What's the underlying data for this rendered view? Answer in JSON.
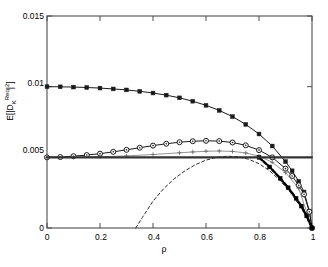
{
  "chart_data": {
    "type": "line",
    "title": "",
    "xlabel": "ρ",
    "ylabel": "E[|D_K^Req|^2]",
    "xlim": [
      0,
      1
    ],
    "ylim": [
      0,
      0.015
    ],
    "grid": false,
    "legend": "none",
    "xticks": [
      "0",
      "0.2",
      "0.4",
      "0.6",
      "0.8",
      "1"
    ],
    "xtick_values": [
      0,
      0.2,
      0.4,
      0.6,
      0.8,
      1
    ],
    "yticks": [
      "0",
      "0.005",
      "0.01",
      "0.015"
    ],
    "ytick_values": [
      0,
      0.005,
      0.01,
      0.015
    ],
    "series": [
      {
        "name": "upper-curve-filled-square",
        "marker": "filled-square",
        "linestyle": "solid",
        "color": "#1a1a1a",
        "x": [
          0.0,
          0.05,
          0.1,
          0.15,
          0.2,
          0.25,
          0.3,
          0.35,
          0.4,
          0.45,
          0.5,
          0.55,
          0.6,
          0.65,
          0.7,
          0.75,
          0.8,
          0.85,
          0.9,
          0.925,
          0.95,
          0.97,
          0.99,
          1.0
        ],
        "y": [
          0.01,
          0.00999,
          0.00997,
          0.00994,
          0.0099,
          0.00984,
          0.00977,
          0.00967,
          0.00955,
          0.0094,
          0.00921,
          0.00897,
          0.00868,
          0.00832,
          0.00788,
          0.00733,
          0.00665,
          0.0058,
          0.0047,
          0.00405,
          0.0033,
          0.00255,
          0.0012,
          0.0
        ]
      },
      {
        "name": "middle-curve-open-circle",
        "marker": "open-circle",
        "linestyle": "solid",
        "color": "#1a1a1a",
        "x": [
          0.0,
          0.05,
          0.1,
          0.15,
          0.2,
          0.25,
          0.3,
          0.35,
          0.4,
          0.45,
          0.5,
          0.55,
          0.6,
          0.65,
          0.7,
          0.75,
          0.8,
          0.85,
          0.9,
          0.925,
          0.95,
          0.97,
          0.99,
          1.0
        ],
        "y": [
          0.005,
          0.00502,
          0.00508,
          0.00516,
          0.00526,
          0.00539,
          0.00553,
          0.00568,
          0.00583,
          0.00596,
          0.00607,
          0.00614,
          0.00617,
          0.00615,
          0.00605,
          0.00585,
          0.00551,
          0.005,
          0.0042,
          0.00368,
          0.00302,
          0.00238,
          0.00115,
          0.0
        ]
      },
      {
        "name": "thin-curve-plus-marker",
        "marker": "plus",
        "linestyle": "thin-solid",
        "color": "#666666",
        "x": [
          0.0,
          0.1,
          0.2,
          0.3,
          0.4,
          0.5,
          0.55,
          0.6,
          0.65,
          0.7,
          0.75,
          0.8,
          0.85,
          0.9,
          0.95,
          1.0
        ],
        "y": [
          0.005,
          0.00501,
          0.00504,
          0.0051,
          0.0052,
          0.00532,
          0.00538,
          0.00543,
          0.00545,
          0.00542,
          0.00531,
          0.00508,
          0.00465,
          0.00392,
          0.0028,
          0.0
        ]
      },
      {
        "name": "lower-dashed-curve",
        "marker": "none",
        "linestyle": "dashed",
        "color": "#2b2b2b",
        "x": [
          0.335,
          0.36,
          0.4,
          0.44,
          0.48,
          0.52,
          0.56,
          0.6,
          0.64,
          0.68,
          0.72,
          0.76,
          0.8,
          0.84,
          0.88,
          0.92,
          0.96,
          1.0
        ],
        "y": [
          0.0,
          0.00075,
          0.0019,
          0.00278,
          0.00348,
          0.00404,
          0.00448,
          0.0048,
          0.005,
          0.00508,
          0.00504,
          0.00487,
          0.00455,
          0.00405,
          0.00335,
          0.00248,
          0.0014,
          0.0
        ]
      },
      {
        "name": "bold-dashed-overlay",
        "marker": "filled-square",
        "linestyle": "bold-dashed",
        "color": "#000000",
        "x": [
          0.8,
          0.84,
          0.88,
          0.91,
          0.94,
          0.96,
          0.98,
          1.0
        ],
        "y": [
          0.005,
          0.00432,
          0.00352,
          0.00285,
          0.0021,
          0.00155,
          0.00085,
          0.0
        ]
      },
      {
        "name": "horizontal-reference-line",
        "marker": "none",
        "linestyle": "solid-thick",
        "color": "#333333",
        "x": [
          0.0,
          1.0
        ],
        "y": [
          0.005,
          0.005
        ]
      }
    ]
  },
  "axes": {
    "x_axis_name": "rho-axis",
    "y_axis_name": "expected-residual-axis"
  }
}
